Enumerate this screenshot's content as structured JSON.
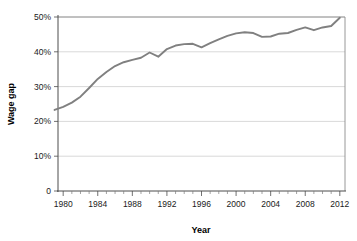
{
  "chart_data": {
    "type": "line",
    "title": "",
    "xlabel": "Year",
    "ylabel": "Wage gap",
    "xlim": [
      1979.4,
      2012.6
    ],
    "ylim": [
      0,
      50
    ],
    "grid": true,
    "legend": null,
    "line_color": "#808080",
    "y_ticks": [
      0,
      10,
      20,
      30,
      40,
      50
    ],
    "y_tick_labels": [
      "0",
      "10%",
      "20%",
      "30%",
      "40%",
      "50%"
    ],
    "x_ticks": [
      1980,
      1984,
      1988,
      1992,
      1996,
      2000,
      2004,
      2008,
      2012
    ],
    "x_tick_labels": [
      "1980",
      "1984",
      "1988",
      "1992",
      "1996",
      "2000",
      "2004",
      "2008",
      "2012"
    ],
    "x_minor_tick_interval": 1,
    "series": [
      {
        "name": "Wage gap",
        "x": [
          1979,
          1980,
          1981,
          1982,
          1983,
          1984,
          1985,
          1986,
          1987,
          1988,
          1989,
          1990,
          1991,
          1992,
          1993,
          1994,
          1995,
          1996,
          1997,
          1998,
          1999,
          2000,
          2001,
          2002,
          2003,
          2004,
          2005,
          2006,
          2007,
          2008,
          2009,
          2010,
          2011,
          2012
        ],
        "values": [
          23.3,
          24.2,
          25.4,
          27.1,
          29.6,
          32.2,
          34.2,
          35.9,
          37.0,
          37.7,
          38.3,
          39.8,
          38.6,
          40.8,
          41.8,
          42.2,
          42.3,
          41.3,
          42.5,
          43.6,
          44.6,
          45.3,
          45.6,
          45.4,
          44.3,
          44.4,
          45.2,
          45.4,
          46.3,
          47.0,
          46.2,
          47.0,
          47.4,
          49.8
        ]
      }
    ]
  }
}
